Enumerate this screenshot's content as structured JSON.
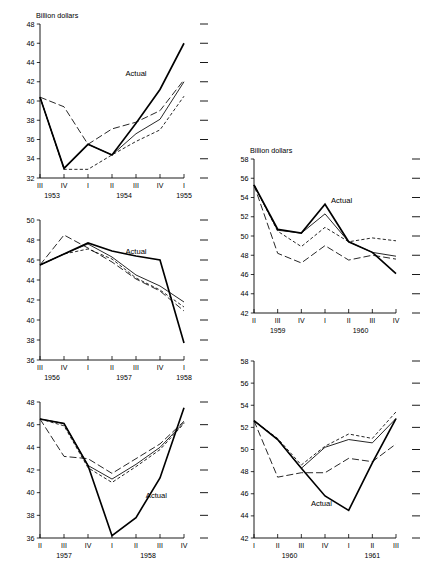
{
  "figure": {
    "axis_unit_label": "Billion dollars",
    "actual_series_label": "Actual",
    "panel_count": 6
  },
  "chart_data": [
    {
      "id": "panel-tl",
      "type": "line",
      "title": "",
      "ylabel": "Billion dollars",
      "xlabel": "",
      "ylim": [
        32,
        48
      ],
      "yticks": [
        32,
        34,
        36,
        38,
        40,
        42,
        44,
        46,
        48
      ],
      "grid": false,
      "legend": "inline-annotation",
      "annotations": [
        {
          "text": "Actual",
          "x_index": 4,
          "y": 42.6
        }
      ],
      "x": [
        "III",
        "IV",
        "I",
        "II",
        "III",
        "IV",
        "I"
      ],
      "xtick_labels": [
        "III",
        "IV",
        "I",
        "II",
        "III",
        "IV",
        "I"
      ],
      "year_groups": [
        {
          "label": "1953",
          "start_index": 0,
          "end_index": 1
        },
        {
          "label": "1954",
          "start_index": 2,
          "end_index": 5
        },
        {
          "label": "1955",
          "start_index": 6,
          "end_index": 6
        }
      ],
      "series": [
        {
          "name": "Actual",
          "style": "solid-thick",
          "values": [
            40.4,
            33.0,
            35.5,
            34.4,
            37.7,
            41.2,
            46.0
          ]
        },
        {
          "name": "Forecast A",
          "style": "long-dash",
          "values": [
            40.4,
            39.4,
            35.5,
            37.1,
            37.8,
            39.0,
            42.2
          ]
        },
        {
          "name": "Forecast B",
          "style": "solid-thin",
          "values": [
            40.4,
            33.0,
            35.5,
            34.4,
            36.6,
            38.1,
            42.0
          ]
        },
        {
          "name": "Forecast C",
          "style": "short-dash",
          "values": [
            40.4,
            32.9,
            32.9,
            34.4,
            35.8,
            37.0,
            40.5
          ]
        }
      ]
    },
    {
      "id": "panel-tr",
      "type": "line",
      "title": "",
      "ylabel": "Billion dollars",
      "xlabel": "",
      "ylim": [
        42,
        58
      ],
      "yticks": [
        42,
        44,
        46,
        48,
        50,
        52,
        54,
        56,
        58
      ],
      "grid": false,
      "legend": "inline-annotation",
      "annotations": [
        {
          "text": "Actual",
          "x_index": 3.7,
          "y": 53.4
        }
      ],
      "x": [
        "II",
        "III",
        "IV",
        "I",
        "II",
        "III",
        "IV"
      ],
      "xtick_labels": [
        "II",
        "III",
        "IV",
        "I",
        "II",
        "III",
        "IV"
      ],
      "year_groups": [
        {
          "label": "1959",
          "start_index": 0,
          "end_index": 2
        },
        {
          "label": "1960",
          "start_index": 3,
          "end_index": 6
        }
      ],
      "series": [
        {
          "name": "Actual",
          "style": "solid-thick",
          "values": [
            55.3,
            50.7,
            50.3,
            53.3,
            49.4,
            48.3,
            46.1
          ]
        },
        {
          "name": "Forecast A",
          "style": "long-dash",
          "values": [
            55.3,
            48.2,
            47.2,
            49.0,
            47.5,
            48.0,
            47.6
          ]
        },
        {
          "name": "Forecast B",
          "style": "solid-thin",
          "values": [
            55.3,
            50.6,
            50.3,
            52.3,
            49.4,
            48.3,
            47.9
          ]
        },
        {
          "name": "Forecast C",
          "style": "short-dash",
          "values": [
            55.3,
            50.5,
            48.9,
            50.9,
            49.4,
            49.8,
            49.5
          ]
        }
      ]
    },
    {
      "id": "panel-ml",
      "type": "line",
      "title": "",
      "ylabel": "",
      "xlabel": "",
      "ylim": [
        36,
        50
      ],
      "yticks": [
        36,
        38,
        40,
        42,
        44,
        46,
        48,
        50
      ],
      "grid": false,
      "legend": "inline-annotation",
      "annotations": [
        {
          "text": "Actual",
          "x_index": 4.0,
          "y": 46.6
        }
      ],
      "x": [
        "III",
        "IV",
        "I",
        "II",
        "III",
        "IV",
        "I"
      ],
      "xtick_labels": [
        "III",
        "IV",
        "I",
        "II",
        "III",
        "IV",
        "I"
      ],
      "year_groups": [
        {
          "label": "1956",
          "start_index": 0,
          "end_index": 1
        },
        {
          "label": "1957",
          "start_index": 2,
          "end_index": 5
        },
        {
          "label": "1958",
          "start_index": 6,
          "end_index": 6
        }
      ],
      "series": [
        {
          "name": "Actual",
          "style": "solid-thick",
          "values": [
            45.5,
            46.6,
            47.7,
            46.9,
            46.4,
            46.0,
            37.7
          ]
        },
        {
          "name": "Forecast A",
          "style": "long-dash",
          "values": [
            45.5,
            48.5,
            47.2,
            45.8,
            44.1,
            42.9,
            40.9
          ]
        },
        {
          "name": "Forecast B",
          "style": "solid-thin",
          "values": [
            45.5,
            46.6,
            47.6,
            46.3,
            44.5,
            43.4,
            41.8
          ]
        },
        {
          "name": "Forecast C",
          "style": "short-dash",
          "values": [
            45.5,
            46.6,
            47.1,
            46.1,
            44.2,
            43.0,
            41.3
          ]
        }
      ]
    },
    {
      "id": "panel-mr",
      "type": "line",
      "title": "",
      "ylabel": "",
      "xlabel": "",
      "ylim": [
        42,
        58
      ],
      "yticks": [
        42,
        44,
        46,
        48,
        50,
        52,
        54,
        56,
        58
      ],
      "grid": false,
      "legend": "inline-annotation",
      "annotations": [
        {
          "text": "Actual",
          "x_index": 2.85,
          "y": 45.0
        }
      ],
      "x": [
        "I",
        "II",
        "III",
        "IV",
        "I",
        "II",
        "III"
      ],
      "xtick_labels": [
        "I",
        "II",
        "III",
        "IV",
        "I",
        "II",
        "III"
      ],
      "year_groups": [
        {
          "label": "1960",
          "start_index": 0,
          "end_index": 3
        },
        {
          "label": "1961",
          "start_index": 4,
          "end_index": 6
        }
      ],
      "series": [
        {
          "name": "Actual",
          "style": "solid-thick",
          "values": [
            52.6,
            50.9,
            48.3,
            45.8,
            44.5,
            48.8,
            52.8
          ]
        },
        {
          "name": "Forecast A",
          "style": "long-dash",
          "values": [
            52.6,
            47.5,
            47.9,
            47.9,
            49.2,
            48.9,
            50.5
          ]
        },
        {
          "name": "Forecast B",
          "style": "solid-thin",
          "values": [
            52.6,
            50.9,
            48.3,
            50.2,
            50.9,
            50.6,
            52.8
          ]
        },
        {
          "name": "Forecast C",
          "style": "short-dash",
          "values": [
            52.6,
            51.0,
            48.6,
            50.3,
            51.4,
            51.0,
            53.4
          ]
        }
      ]
    },
    {
      "id": "panel-bl",
      "type": "line",
      "title": "",
      "ylabel": "",
      "xlabel": "",
      "ylim": [
        36,
        48
      ],
      "yticks": [
        36,
        38,
        40,
        42,
        44,
        46,
        48
      ],
      "grid": false,
      "legend": "inline-annotation",
      "annotations": [
        {
          "text": "Actual",
          "x_index": 4.85,
          "y": 39.5
        }
      ],
      "x": [
        "II",
        "III",
        "IV",
        "I",
        "II",
        "III",
        "IV"
      ],
      "xtick_labels": [
        "II",
        "III",
        "IV",
        "I",
        "II",
        "III",
        "IV"
      ],
      "year_groups": [
        {
          "label": "1957",
          "start_index": 0,
          "end_index": 2
        },
        {
          "label": "1958",
          "start_index": 3,
          "end_index": 6
        }
      ],
      "series": [
        {
          "name": "Actual",
          "style": "solid-thick",
          "values": [
            46.5,
            46.1,
            42.4,
            36.2,
            37.8,
            41.3,
            47.5
          ]
        },
        {
          "name": "Forecast A",
          "style": "long-dash",
          "values": [
            46.5,
            43.2,
            43.0,
            41.7,
            43.0,
            44.3,
            46.3
          ]
        },
        {
          "name": "Forecast B",
          "style": "solid-thin",
          "values": [
            46.5,
            46.1,
            42.4,
            41.2,
            42.5,
            44.0,
            46.2
          ]
        },
        {
          "name": "Forecast C",
          "style": "short-dash",
          "values": [
            46.5,
            45.9,
            42.2,
            40.9,
            42.3,
            43.8,
            46.1
          ]
        }
      ]
    },
    {
      "id": "panel-br",
      "type": "line",
      "title": "",
      "ylabel": "",
      "xlabel": "",
      "ylim": [
        42,
        58
      ],
      "yticks": [
        42,
        44,
        46,
        48,
        50,
        52,
        54,
        56,
        58
      ],
      "grid": false,
      "legend": "inline-annotation",
      "annotations": [
        {
          "text": "Actual",
          "x_index": 2.85,
          "y": 44.9
        }
      ],
      "x": [
        "I",
        "II",
        "III",
        "IV",
        "I",
        "II",
        "III"
      ],
      "xtick_labels": [
        "I",
        "II",
        "III",
        "IV",
        "I",
        "II",
        "III"
      ],
      "year_groups": [
        {
          "label": "1960",
          "start_index": 0,
          "end_index": 3
        },
        {
          "label": "1961",
          "start_index": 4,
          "end_index": 6
        }
      ],
      "series": [
        {
          "name": "Actual",
          "style": "solid-thick",
          "values": [
            52.6,
            50.9,
            48.3,
            45.8,
            44.5,
            48.8,
            52.8
          ]
        },
        {
          "name": "Forecast A",
          "style": "long-dash",
          "values": [
            52.6,
            47.5,
            47.9,
            47.9,
            49.2,
            48.9,
            50.5
          ]
        },
        {
          "name": "Forecast B",
          "style": "solid-thin",
          "values": [
            52.6,
            50.9,
            48.3,
            50.2,
            50.9,
            50.6,
            52.8
          ]
        },
        {
          "name": "Forecast C",
          "style": "short-dash",
          "values": [
            52.6,
            51.0,
            48.6,
            50.3,
            51.4,
            51.0,
            53.4
          ]
        }
      ]
    }
  ],
  "panel_layout": [
    {
      "id": "panel-tl",
      "left": 14,
      "top": 8,
      "width": 200,
      "height": 196,
      "show_unit": true
    },
    {
      "id": "panel-tr",
      "left": 228,
      "top": 143,
      "width": 198,
      "height": 196,
      "show_unit": true
    },
    {
      "id": "panel-ml",
      "left": 14,
      "top": 214,
      "width": 200,
      "height": 172,
      "show_unit": false
    },
    {
      "id": "panel-bl",
      "left": 14,
      "top": 396,
      "width": 200,
      "height": 168,
      "show_unit": false
    },
    {
      "id": "panel-br",
      "left": 228,
      "top": 355,
      "width": 198,
      "height": 209,
      "show_unit": false
    }
  ]
}
